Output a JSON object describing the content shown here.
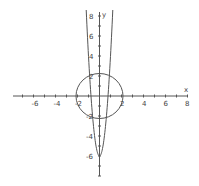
{
  "chart_data": {
    "type": "line",
    "title": "",
    "xlabel": "x",
    "ylabel": "y",
    "xlim": [
      -8,
      8
    ],
    "ylim": [
      -8,
      8
    ],
    "grid": false,
    "x_tick_labels": [
      "-6",
      "-4",
      "-2",
      "2",
      "4",
      "6",
      "8"
    ],
    "y_tick_labels": [
      "8",
      "6",
      "4",
      "2",
      "-2",
      "-4",
      "-6"
    ],
    "series": [
      {
        "name": "circle",
        "equation": "x^2 + y^2 = 4",
        "center": [
          0,
          0
        ],
        "radius": 2
      },
      {
        "name": "parabola",
        "equation": "y = 10x^2 - 6",
        "vertex": [
          0,
          -6
        ],
        "x_intercepts": [
          -0.77,
          0.77
        ],
        "points": [
          [
            -1.2,
            8.4
          ],
          [
            -0.77,
            0
          ],
          [
            0,
            -6
          ],
          [
            0.77,
            0
          ],
          [
            1.2,
            8.4
          ]
        ]
      }
    ],
    "colors": {
      "axis": "#555555",
      "curve": "#555555",
      "text": "#444444"
    }
  }
}
